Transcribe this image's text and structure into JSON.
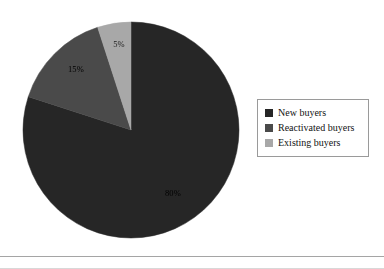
{
  "figure": {
    "background_color": "#ffffff",
    "rule_color": "#a5a5a5"
  },
  "chart_data": {
    "type": "pie",
    "title": "",
    "labels": [
      "New buyers",
      "Reactivated buyers",
      "Existing buyers"
    ],
    "values": [
      80,
      15,
      5
    ],
    "value_labels": [
      "80%",
      "15%",
      "5%"
    ],
    "colors": [
      "#262626",
      "#4a4a4a",
      "#a8a8a8"
    ],
    "start_angle_deg": 90,
    "direction": "clockwise",
    "legend_position": "right",
    "grid": false,
    "units": "percent",
    "total": 100
  },
  "pie": {
    "center_x": 110,
    "center_y": 110,
    "radius": 108,
    "slices": [
      {
        "name": "New buyers",
        "value": 80,
        "label": "80%",
        "color": "#262626",
        "label_x": 152,
        "label_y": 174,
        "label_tone": "on-dark"
      },
      {
        "name": "Reactivated buyers",
        "value": 15,
        "label": "15%",
        "color": "#4a4a4a",
        "label_x": 55,
        "label_y": 50,
        "label_tone": "on-dark"
      },
      {
        "name": "Existing buyers",
        "value": 5,
        "label": "5%",
        "color": "#a8a8a8",
        "label_x": 98,
        "label_y": 25,
        "label_tone": "on-light"
      }
    ]
  },
  "legend": {
    "items": [
      {
        "label": "New buyers",
        "color": "#262626"
      },
      {
        "label": "Reactivated buyers",
        "color": "#4a4a4a"
      },
      {
        "label": "Existing buyers",
        "color": "#a8a8a8"
      }
    ]
  }
}
